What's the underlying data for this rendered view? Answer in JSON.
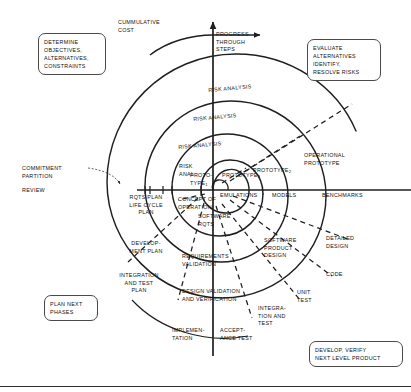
{
  "diagram": {
    "axes": {
      "vertical_label": "CUMMULATIVE\nCOST",
      "horizontal_label": "PROGRESS\nTHROUGH\nSTEPS",
      "review_label": "REVIEW",
      "commitment_label": "COMMITMENT\nPARTITION"
    },
    "quadrant_boxes": [
      {
        "id": "q1",
        "name": "determine-objectives",
        "text": "DETERMINE\nOBJECTIVES,\nALTERNATIVES,\nCONSTRAINTS"
      },
      {
        "id": "q2",
        "name": "evaluate-alternatives",
        "text": "EVALUATE\nALTERNATIVES\nIDENTIFY,\nRESOLVE RISKS"
      },
      {
        "id": "q3",
        "name": "plan-next-phases",
        "text": "PLAN NEXT\nPHASES"
      },
      {
        "id": "q4",
        "name": "develop-verify",
        "text": "DEVELOP, VERIFY\nNEXT LEVEL PRODUCT"
      }
    ],
    "risk_analysis": [
      {
        "text": "RISK ANALYSIS"
      },
      {
        "text": "RISK ANALYSIS"
      },
      {
        "text": "RISK ANALYSIS"
      },
      {
        "text": "RISK\nANAL"
      }
    ],
    "prototypes": [
      {
        "text": "PROTO-\nTYPE",
        "sub": "1"
      },
      {
        "text": "PROTOTYPE",
        "sub": "3"
      },
      {
        "text": "PROTOTYPE",
        "sub": "2"
      },
      {
        "text": "OPERATIONAL\nPROTOTYPE",
        "sub": ""
      }
    ],
    "evaluation_band": [
      {
        "text": "CONCEPT OF\nOPERATION"
      },
      {
        "text": "EMULATIONS"
      },
      {
        "text": "MODELS"
      },
      {
        "text": "BENCHMARKS"
      }
    ],
    "plan_band": [
      {
        "text": "RQTS PLAN\nLIFE CYCLE\nPLAN"
      },
      {
        "text": "DEVELOP-\nMENT PLAN"
      },
      {
        "text": "INTEGRATION\nAND TEST\nPLAN"
      }
    ],
    "develop_band": [
      {
        "text": "SOFTWARE\nRQTS"
      },
      {
        "text": "SOFTWARE\nPRODUCT\nDESIGN"
      },
      {
        "text": "DETAILED\nDESIGN"
      },
      {
        "text": "CODE"
      }
    ],
    "verify_band": [
      {
        "text": "REQUIREMENTS\nVALIDATION"
      },
      {
        "text": "DESIGN VALIDATION\nAND VERIFICATION"
      },
      {
        "text": "UNIT\nTEST"
      },
      {
        "text": "INTEGRA-\nTION AND\nTEST"
      },
      {
        "text": "ACCEPT-\nANCE TEST"
      },
      {
        "text": "IMPLEMEN-\nTATION"
      }
    ],
    "colors": {
      "ink": "#111111",
      "line": "#1f1f1f",
      "box_border": "#4a4a4a",
      "background": "#ffffff"
    }
  }
}
